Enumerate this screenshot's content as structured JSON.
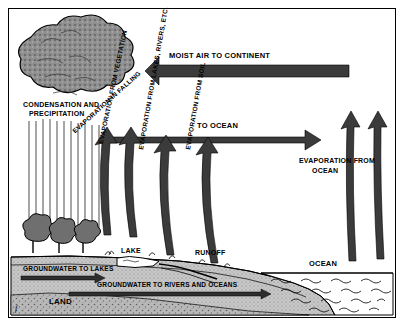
{
  "diagram": {
    "labels": {
      "moist_air": "MOIST AIR TO CONTINENT",
      "condensation": "CONDENSATION AND",
      "precipitation": "PRECIPITATION",
      "to_ocean": "TO OCEAN",
      "evap_falling": "EVAPORATION IN FALLING",
      "evap_vegetation": "EVAPORATION FROM VEGETATION",
      "evap_lakes": "EVAPORATION FROM LAKES, RIVERS, ETC.",
      "evap_soil": "EVAPORATION FROM SOIL",
      "evap_ocean_1": "EVAPORATION FROM",
      "evap_ocean_2": "OCEAN",
      "groundwater_lakes": "GROUNDWATER TO LAKES",
      "groundwater_rivers": "GROUNDWATER TO RIVERS AND OCEANS",
      "lake": "LAKE",
      "runoff": "RUNOFF",
      "ocean": "OCEAN",
      "land": "LAND",
      "corner_mark": "f"
    },
    "colors": {
      "ink": "#000000",
      "paper": "#ffffff",
      "cloud_fill": "#8f8f8f",
      "ground_fill": "#c9c9c9",
      "ocean_fill": "#ffffff",
      "arrow_fill": "#3b3b3b",
      "bedrock_fill": "#b3b3b3"
    }
  }
}
